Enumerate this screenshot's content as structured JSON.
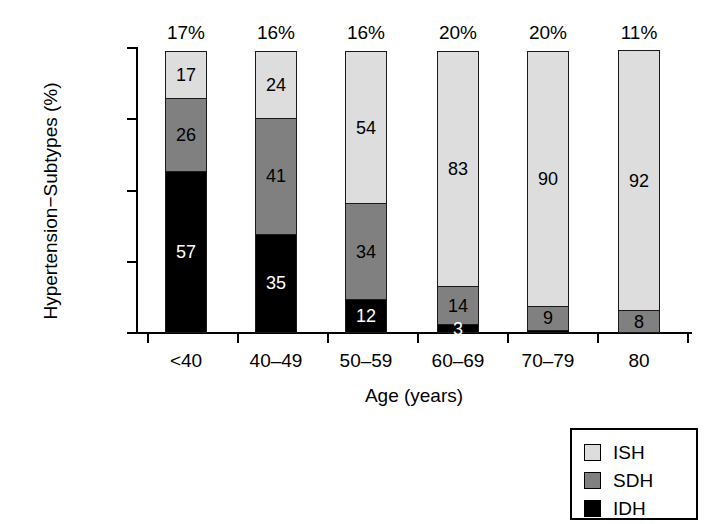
{
  "chart_data": {
    "type": "bar",
    "subtype": "stacked-bar-100",
    "title": "",
    "xlabel": "Age (years)",
    "ylabel": "Hypertension−Subtypes (%)",
    "categories": [
      "<40",
      "40–49",
      "50–59",
      "60–69",
      "70–79",
      "80"
    ],
    "ylim": [
      0,
      100
    ],
    "yticks": [
      "0",
      "25",
      "50",
      "75",
      "100"
    ],
    "ytick_values": [
      0,
      25,
      50,
      75,
      100
    ],
    "grid": false,
    "legend_position": "bottom-right",
    "series": [
      {
        "name": "ISH",
        "color": "#dddddd",
        "values": [
          17,
          24,
          54,
          83,
          90,
          92
        ]
      },
      {
        "name": "SDH",
        "color": "#808080",
        "values": [
          26,
          41,
          34,
          14,
          9,
          8
        ]
      },
      {
        "name": "IDH",
        "color": "#000000",
        "values": [
          57,
          35,
          12,
          3,
          1,
          0
        ]
      }
    ],
    "bar_top_annotations": [
      "17%",
      "16%",
      "16%",
      "20%",
      "20%",
      "11%"
    ],
    "segment_labels": [
      [
        {
          "series": "ISH",
          "label": "17"
        },
        {
          "series": "SDH",
          "label": "26"
        },
        {
          "series": "IDH",
          "label": "57"
        }
      ],
      [
        {
          "series": "ISH",
          "label": "24"
        },
        {
          "series": "SDH",
          "label": "41"
        },
        {
          "series": "IDH",
          "label": "35"
        }
      ],
      [
        {
          "series": "ISH",
          "label": "54"
        },
        {
          "series": "SDH",
          "label": "34"
        },
        {
          "series": "IDH",
          "label": "12"
        }
      ],
      [
        {
          "series": "ISH",
          "label": "83"
        },
        {
          "series": "SDH",
          "label": "14"
        },
        {
          "series": "IDH",
          "label": "3"
        }
      ],
      [
        {
          "series": "ISH",
          "label": "90"
        },
        {
          "series": "SDH",
          "label": "9"
        },
        {
          "series": "IDH",
          "label": ""
        }
      ],
      [
        {
          "series": "ISH",
          "label": "92"
        },
        {
          "series": "SDH",
          "label": "8"
        },
        {
          "series": "IDH",
          "label": ""
        }
      ]
    ]
  },
  "legend": {
    "items": [
      {
        "label": "ISH",
        "color": "#dddddd"
      },
      {
        "label": "SDH",
        "color": "#808080"
      },
      {
        "label": "IDH",
        "color": "#000000"
      }
    ]
  }
}
